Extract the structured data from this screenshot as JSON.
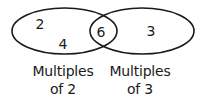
{
  "diagram": {
    "type": "venn",
    "stroke_color": "#1a1a1a",
    "background": "#ffffff",
    "sets": [
      {
        "id": "set-a",
        "label_line1": "Multiples",
        "label_line2": "of 2",
        "only_elements": [
          "2",
          "4"
        ]
      },
      {
        "id": "set-b",
        "label_line1": "Multiples",
        "label_line2": "of 3",
        "only_elements": [
          "3"
        ]
      }
    ],
    "intersection": {
      "elements": [
        "6"
      ]
    }
  }
}
